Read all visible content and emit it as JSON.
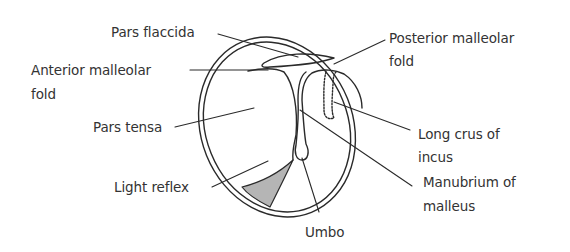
{
  "diagram": {
    "type": "anatomical",
    "colors": {
      "stroke": "#2a2a2a",
      "text": "#333333",
      "light_reflex_fill": "#b5b5b5",
      "background": "#ffffff"
    },
    "labels": {
      "pars_flaccida": "Pars flaccida",
      "anterior_malleolar_fold_1": "Anterior malleolar",
      "anterior_malleolar_fold_2": "fold",
      "pars_tensa": "Pars tensa",
      "light_reflex": "Light reflex",
      "posterior_malleolar_fold_1": "Posterior malleolar",
      "posterior_malleolar_fold_2": "fold",
      "long_crus_of_incus_1": "Long crus of",
      "long_crus_of_incus_2": "incus",
      "manubrium_of_malleus_1": "Manubrium of",
      "manubrium_of_malleus_2": "malleus",
      "umbo": "Umbo"
    }
  }
}
